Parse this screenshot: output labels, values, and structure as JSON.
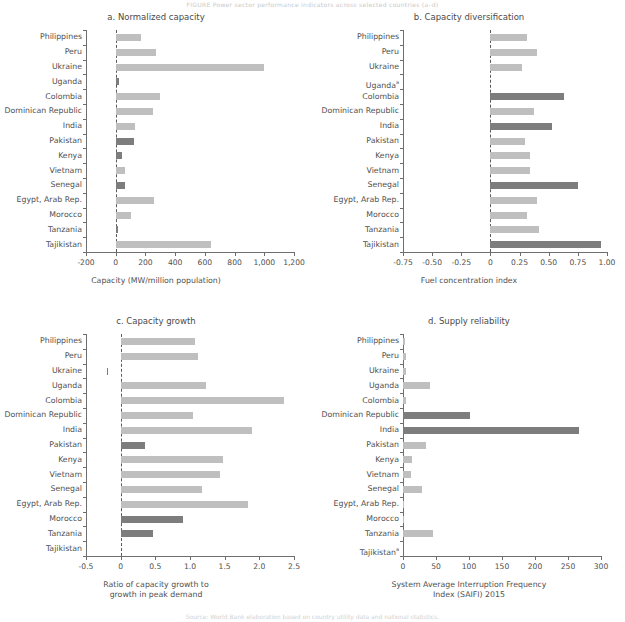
{
  "figure": {
    "top_caption": "FIGURE  Power sector performance indicators across selected countries (a–d)",
    "bottom_caption": "Source: World Bank elaboration based on country utility data and national statistics.",
    "categories": [
      "Philippines",
      "Peru",
      "Ukraine",
      "Uganda",
      "Colombia",
      "Dominican Republic",
      "India",
      "Pakistan",
      "Kenya",
      "Vietnam",
      "Senegal",
      "Egypt, Arab Rep.",
      "Morocco",
      "Tanzania",
      "Tajikistan"
    ],
    "colors": {
      "bar_light": "#bfbfbf",
      "bar_dark": "#7d7d7d",
      "axis": "#6e6e6e",
      "text": "#4f4f4f",
      "background": "#ffffff"
    }
  },
  "chart_data": [
    {
      "type": "bar",
      "panel": "a",
      "title": "a. Normalized capacity",
      "orientation": "horizontal",
      "xlabel": "Capacity (MW/million population)",
      "ylabel": "",
      "xlim": [
        -200,
        1200
      ],
      "xticks": [
        -200,
        0,
        200,
        400,
        600,
        800,
        1000,
        1200
      ],
      "xticklabels": [
        "-200",
        "0",
        "200",
        "400",
        "600",
        "800",
        "1,000",
        "1,200"
      ],
      "grid": false,
      "zero_reference_line": true,
      "categories": [
        "Philippines",
        "Peru",
        "Ukraine",
        "Uganda",
        "Colombia",
        "Dominican Republic",
        "India",
        "Pakistan",
        "Kenya",
        "Vietnam",
        "Senegal",
        "Egypt, Arab Rep.",
        "Morocco",
        "Tanzania",
        "Tajikistan"
      ],
      "values": [
        170,
        270,
        1000,
        20,
        300,
        250,
        130,
        120,
        45,
        60,
        60,
        260,
        100,
        15,
        640
      ],
      "shades": [
        "light",
        "light",
        "light",
        "dark",
        "light",
        "light",
        "light",
        "dark",
        "dark",
        "light",
        "dark",
        "light",
        "light",
        "dark",
        "light"
      ]
    },
    {
      "type": "bar",
      "panel": "b",
      "title": "b. Capacity diversification",
      "orientation": "horizontal",
      "xlabel": "Fuel concentration index",
      "ylabel": "",
      "xlim": [
        -0.75,
        1.0
      ],
      "xticks": [
        -0.75,
        -0.5,
        -0.25,
        0,
        0.25,
        0.5,
        0.75,
        1.0
      ],
      "xticklabels": [
        "-0.75",
        "-0.50",
        "-0.25",
        "0",
        "0.25",
        "0.50",
        "0.75",
        "1.00"
      ],
      "grid": false,
      "zero_reference_line": true,
      "categories": [
        "Philippines",
        "Peru",
        "Ukraine",
        "Ugandaᵃ",
        "Colombia",
        "Dominican Republic",
        "India",
        "Pakistan",
        "Kenya",
        "Vietnam",
        "Senegal",
        "Egypt, Arab Rep.",
        "Morocco",
        "Tanzania",
        "Tajikistan"
      ],
      "values": [
        0.31,
        0.4,
        0.27,
        null,
        0.63,
        0.37,
        0.53,
        0.3,
        0.34,
        0.34,
        0.75,
        0.4,
        0.31,
        0.42,
        0.95
      ],
      "shades": [
        "light",
        "light",
        "light",
        "none",
        "dark",
        "light",
        "dark",
        "light",
        "light",
        "light",
        "dark",
        "light",
        "light",
        "light",
        "dark"
      ]
    },
    {
      "type": "bar",
      "panel": "c",
      "title": "c. Capacity growth",
      "orientation": "horizontal",
      "xlabel": "Ratio of capacity growth to growth in peak demand",
      "xlabel_line1": "Ratio of capacity growth to",
      "xlabel_line2": "growth in peak demand",
      "ylabel": "",
      "xlim": [
        -0.5,
        2.5
      ],
      "xticks": [
        -0.5,
        0,
        0.5,
        1.0,
        1.5,
        2.0,
        2.5
      ],
      "xticklabels": [
        "-0.5",
        "0",
        "0.5",
        "1.0",
        "1.5",
        "2.0",
        "2.5"
      ],
      "grid": false,
      "zero_reference_line": true,
      "categories": [
        "Philippines",
        "Peru",
        "Ukraine",
        "Uganda",
        "Colombia",
        "Dominican Republic",
        "India",
        "Pakistan",
        "Kenya",
        "Vietnam",
        "Senegal",
        "Egypt, Arab Rep.",
        "Morocco",
        "Tanzania",
        "Tajikistan"
      ],
      "values": [
        1.07,
        1.12,
        -0.2,
        1.23,
        2.35,
        1.05,
        1.9,
        0.35,
        1.47,
        1.44,
        1.18,
        1.84,
        0.9,
        0.46,
        null
      ],
      "shades": [
        "light",
        "light",
        "dark",
        "light",
        "light",
        "light",
        "light",
        "dark",
        "light",
        "light",
        "light",
        "light",
        "dark",
        "dark",
        "none"
      ]
    },
    {
      "type": "bar",
      "panel": "d",
      "title": "d. Supply reliability",
      "orientation": "horizontal",
      "xlabel": "System Average Interruption Frequency Index (SAIFI) 2015",
      "xlabel_line1": "System Average Interruption Frequency",
      "xlabel_line2": "Index (SAIFI) 2015",
      "ylabel": "",
      "xlim": [
        0,
        300
      ],
      "xticks": [
        0,
        50,
        100,
        150,
        200,
        250,
        300
      ],
      "xticklabels": [
        "0",
        "50",
        "100",
        "150",
        "200",
        "250",
        "300"
      ],
      "grid": false,
      "zero_reference_line": false,
      "categories": [
        "Philippines",
        "Peru",
        "Ukraine",
        "Uganda",
        "Colombia",
        "Dominican Republic",
        "India",
        "Pakistan",
        "Kenya",
        "Vietnam",
        "Senegal",
        "Egypt, Arab Rep.",
        "Morocco",
        "Tanzania",
        "Tajikistanᵃ"
      ],
      "values": [
        3,
        4,
        4,
        41,
        5,
        102,
        266,
        35,
        13,
        12,
        29,
        1,
        2,
        46,
        null
      ],
      "shades": [
        "light",
        "light",
        "light",
        "light",
        "light",
        "dark",
        "dark",
        "light",
        "light",
        "light",
        "light",
        "light",
        "light",
        "light",
        "none"
      ]
    }
  ]
}
